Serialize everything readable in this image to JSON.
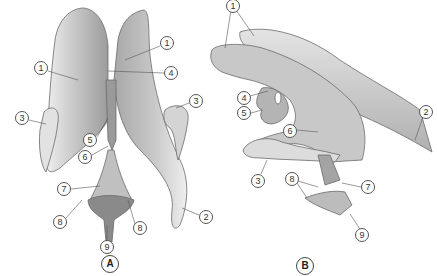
{
  "diagram": {
    "type": "anatomical illustration",
    "figures": [
      {
        "id": "A",
        "label": "A",
        "view": "superior",
        "callouts": [
          {
            "num": "1",
            "x": 41,
            "y": 68
          },
          {
            "num": "1",
            "x": 167,
            "y": 43
          },
          {
            "num": "4",
            "x": 171,
            "y": 73
          },
          {
            "num": "3",
            "x": 22,
            "y": 118
          },
          {
            "num": "3",
            "x": 196,
            "y": 101
          },
          {
            "num": "5",
            "x": 90,
            "y": 140
          },
          {
            "num": "6",
            "x": 85,
            "y": 157
          },
          {
            "num": "7",
            "x": 64,
            "y": 189
          },
          {
            "num": "8",
            "x": 60,
            "y": 222
          },
          {
            "num": "8",
            "x": 140,
            "y": 228
          },
          {
            "num": "2",
            "x": 206,
            "y": 217
          },
          {
            "num": "9",
            "x": 107,
            "y": 247
          }
        ]
      },
      {
        "id": "B",
        "label": "B",
        "view": "lateral",
        "callouts": [
          {
            "num": "1",
            "x": 233,
            "y": 6
          },
          {
            "num": "2",
            "x": 426,
            "y": 112
          },
          {
            "num": "4",
            "x": 244,
            "y": 98
          },
          {
            "num": "5",
            "x": 244,
            "y": 113
          },
          {
            "num": "6",
            "x": 290,
            "y": 131
          },
          {
            "num": "3",
            "x": 258,
            "y": 181
          },
          {
            "num": "8",
            "x": 292,
            "y": 179
          },
          {
            "num": "7",
            "x": 368,
            "y": 187
          },
          {
            "num": "9",
            "x": 362,
            "y": 235
          }
        ]
      }
    ],
    "figure_labels": [
      {
        "text": "A",
        "x": 110,
        "y": 264
      },
      {
        "text": "B",
        "x": 305,
        "y": 266
      }
    ],
    "colors": {
      "fill_light": "#d9d9d9",
      "fill_mid": "#b8b8b8",
      "fill_dark": "#8f8f8f",
      "outline": "#6a6a6a",
      "leader_line": "#555555"
    }
  }
}
